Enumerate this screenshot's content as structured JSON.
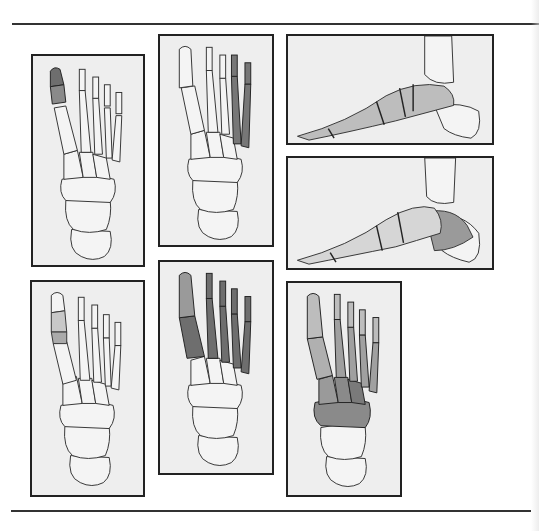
{
  "figure": {
    "colors": {
      "page_background": "#ffffff",
      "panel_background": "#eeeeee",
      "panel_border": "#222222",
      "bone_fill": "#f4f4f4",
      "bone_outline": "#333333",
      "shaded_bone": "#7a7a7a",
      "rule_line": "#333333"
    },
    "panels": [
      {
        "id": 1,
        "view": "dorsal",
        "highlight": "great toe distal/proximal phalanx",
        "box": [
          31,
          54,
          114,
          213
        ]
      },
      {
        "id": 2,
        "view": "dorsal",
        "highlight": "4th and 5th rays (lateral toes and metatarsals)",
        "box": [
          158,
          34,
          116,
          213
        ]
      },
      {
        "id": 3,
        "view": "lateral",
        "highlight": "midfoot and forefoot bones",
        "box": [
          286,
          34,
          208,
          111
        ]
      },
      {
        "id": 4,
        "view": "lateral",
        "highlight": "calcaneus/heel and midfoot",
        "box": [
          286,
          156,
          208,
          114
        ]
      },
      {
        "id": 5,
        "view": "dorsal",
        "highlight": "first metatarsophalangeal joint region",
        "box": [
          30,
          280,
          115,
          217
        ]
      },
      {
        "id": 6,
        "view": "dorsal",
        "highlight": "all metatarsals and phalanges",
        "box": [
          158,
          260,
          116,
          215
        ]
      },
      {
        "id": 7,
        "view": "dorsal",
        "highlight": "tarsals, metatarsals and phalanges",
        "box": [
          286,
          281,
          116,
          216
        ]
      }
    ]
  }
}
